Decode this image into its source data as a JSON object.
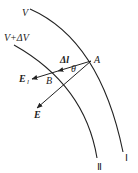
{
  "diagram": {
    "title": "",
    "equipotentials": [
      {
        "id": "I",
        "potential_label": "V",
        "curve_label": "Ⅰ"
      },
      {
        "id": "II",
        "potential_label": "V+ΔV",
        "curve_label": "Ⅱ"
      }
    ],
    "points": {
      "A": "A",
      "B": "B"
    },
    "vectors": {
      "displacement": "Δl",
      "tangential_field": "E",
      "tangential_sub": "l",
      "field": "E"
    },
    "angle": "θ"
  }
}
